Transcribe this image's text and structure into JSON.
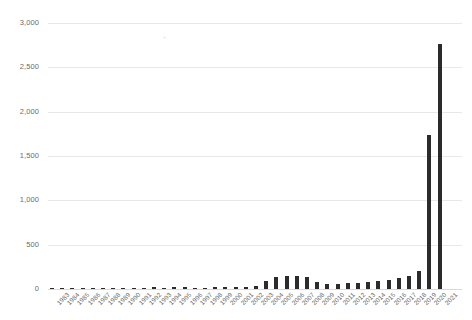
{
  "chart_data": {
    "type": "bar",
    "title": "",
    "subtitle": "",
    "xlabel": "",
    "ylabel": "",
    "ylim": [
      0,
      3000
    ],
    "ytick_labels": [
      "0",
      "500",
      "1,000",
      "1,500",
      "2,000",
      "2,500",
      "3,000"
    ],
    "ytick_values": [
      0,
      500,
      1000,
      1500,
      2000,
      2500,
      3000
    ],
    "grid": true,
    "legend": "none",
    "bar_color": "#2b2b2b",
    "gridline_color": "#e8e8e8",
    "categories": [
      "1983",
      "1984",
      "1985",
      "1986",
      "1987",
      "1988",
      "1989",
      "1990",
      "1991",
      "1992",
      "1993",
      "1994",
      "1995",
      "1996",
      "1997",
      "1998",
      "1999",
      "2000",
      "2001",
      "2002",
      "2003",
      "2004",
      "2005",
      "2006",
      "2007",
      "2008",
      "2009",
      "2010",
      "2011",
      "2012",
      "2013",
      "2014",
      "2015",
      "2016",
      "2017",
      "2018",
      "2019",
      "2020",
      "2021"
    ],
    "values": [
      3,
      4,
      4,
      5,
      6,
      6,
      8,
      14,
      10,
      12,
      18,
      16,
      22,
      20,
      14,
      16,
      18,
      22,
      20,
      28,
      32,
      95,
      135,
      150,
      145,
      130,
      80,
      62,
      60,
      64,
      70,
      78,
      90,
      100,
      120,
      150,
      200,
      1740,
      2760
    ]
  }
}
